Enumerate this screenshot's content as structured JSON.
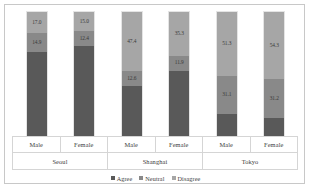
{
  "chart_data": {
    "type": "bar",
    "subtype": "stacked-100-percent",
    "title": "",
    "subtitle": "",
    "xlabel": "",
    "ylabel": "",
    "ylim": [
      0,
      100
    ],
    "grid": false,
    "legend_position": "bottom",
    "orientation": "vertical",
    "stack_order_bottom_to_top": [
      "Agree",
      "Neutral",
      "Disagree"
    ],
    "value_labels_shown_for": [
      "Neutral",
      "Disagree"
    ],
    "categories": [
      "Seoul Male",
      "Seoul Female",
      "Shanghai Male",
      "Shanghai Female",
      "Tokyo Male",
      "Tokyo Female"
    ],
    "groups": [
      {
        "city": "Seoul",
        "bars": [
          {
            "gender": "Male",
            "agree": 68.1,
            "neutral": 14.9,
            "disagree": 17.0,
            "agree_label": "",
            "neutral_label": "14.9",
            "disagree_label": "17.0"
          },
          {
            "gender": "Female",
            "agree": 72.6,
            "neutral": 12.4,
            "disagree": 15.0,
            "agree_label": "",
            "neutral_label": "12.4",
            "disagree_label": "15.0"
          }
        ]
      },
      {
        "city": "Shanghai",
        "bars": [
          {
            "gender": "Male",
            "agree": 40.0,
            "neutral": 12.6,
            "disagree": 47.4,
            "agree_label": "",
            "neutral_label": "12.6",
            "disagree_label": "47.4"
          },
          {
            "gender": "Female",
            "agree": 52.8,
            "neutral": 11.9,
            "disagree": 35.3,
            "agree_label": "",
            "neutral_label": "11.9",
            "disagree_label": "35.3"
          }
        ]
      },
      {
        "city": "Tokyo",
        "bars": [
          {
            "gender": "Male",
            "agree": 17.6,
            "neutral": 31.1,
            "disagree": 51.3,
            "agree_label": "",
            "neutral_label": "31.1",
            "disagree_label": "51.3"
          },
          {
            "gender": "Female",
            "agree": 14.5,
            "neutral": 31.2,
            "disagree": 54.3,
            "agree_label": "",
            "neutral_label": "31.2",
            "disagree_label": "54.3"
          }
        ]
      }
    ],
    "series": [
      {
        "name": "Agree",
        "color": "#595959",
        "values": [
          68.1,
          72.6,
          40.0,
          52.8,
          17.6,
          14.5
        ]
      },
      {
        "name": "Neutral",
        "color": "#898989",
        "values": [
          14.9,
          12.4,
          12.6,
          11.9,
          31.1,
          31.2
        ]
      },
      {
        "name": "Disagree",
        "color": "#a6a6a6",
        "values": [
          17.0,
          15.0,
          47.4,
          35.3,
          51.3,
          54.3
        ]
      }
    ]
  },
  "axis": {
    "gender_labels": [
      "Male",
      "Female",
      "Male",
      "Female",
      "Male",
      "Female"
    ],
    "city_labels": [
      "Seoul",
      "Shanghai",
      "Tokyo"
    ]
  },
  "legend": {
    "items": [
      {
        "label": "Agree",
        "color": "#595959"
      },
      {
        "label": "Neutral",
        "color": "#898989"
      },
      {
        "label": "Disagree",
        "color": "#a6a6a6"
      }
    ]
  },
  "colors": {
    "agree": "#595959",
    "neutral": "#898989",
    "disagree": "#a6a6a6",
    "frame_border": "#c8c8c8",
    "table_border": "#d5d5d5",
    "background": "#ffffff",
    "label_text": "#3c3c3c"
  }
}
